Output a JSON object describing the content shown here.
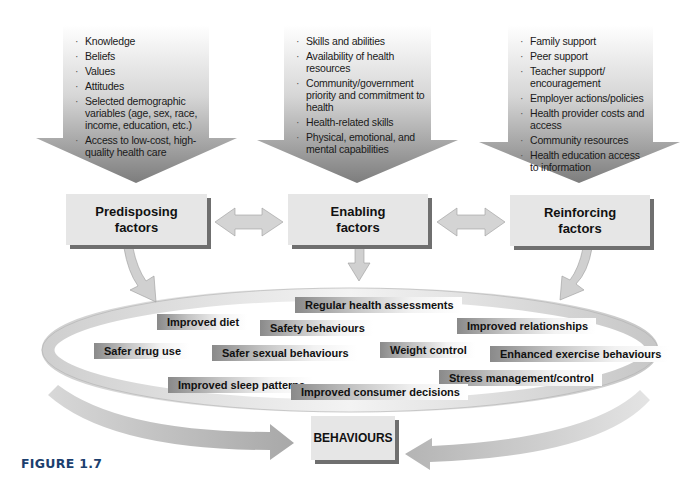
{
  "figure": {
    "label": "FIGURE 1.7"
  },
  "columns": [
    {
      "title": "Predisposing factors",
      "title_line1": "Predisposing",
      "title_line2": "factors",
      "items": [
        "Knowledge",
        "Beliefs",
        "Values",
        "Attitudes",
        "Selected demographic variables (age, sex, race, income, education, etc.)",
        "Access to low-cost, high-quality health care"
      ]
    },
    {
      "title": "Enabling factors",
      "title_line1": "Enabling",
      "title_line2": "factors",
      "items": [
        "Skills and abilities",
        "Availability of health resources",
        "Community/government priority and commitment to health",
        "Health-related skills",
        "Physical, emotional, and mental capabilities"
      ]
    },
    {
      "title": "Reinforcing factors",
      "title_line1": "Reinforcing",
      "title_line2": "factors",
      "items": [
        "Family support",
        "Peer support",
        "Teacher support/ encouragement",
        "Employer actions/policies",
        "Health provider costs and access",
        "Community resources",
        "Health education access to information"
      ]
    }
  ],
  "behaviour_tags": [
    "Regular health assessments",
    "Improved diet",
    "Safety behaviours",
    "Improved relationships",
    "Safer drug use",
    "Safer sexual behaviours",
    "Weight control",
    "Enhanced exercise behaviours",
    "Stress management/control",
    "Improved sleep patterns",
    "Improved consumer decisions"
  ],
  "outcome": {
    "label": "BEHAVIOURS"
  },
  "colors": {
    "box_fill": "#e6e6e6",
    "box_shadow": "#6f6f6f",
    "arrow_dark": "#8c8c8c",
    "arrow_light": "#e8e8e8",
    "figure_label": "#1c3f6e"
  }
}
